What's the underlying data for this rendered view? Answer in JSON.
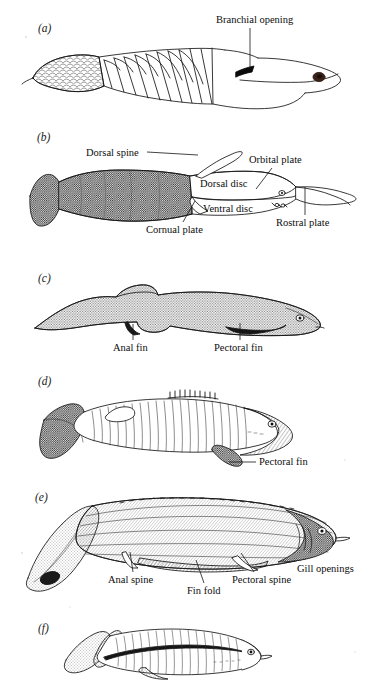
{
  "figure": {
    "background_color": "#ffffff",
    "ink_color": "#111111",
    "caption_note": "Six labeled lateral-view reconstructions of early jawless and jawed fishes",
    "panels": [
      {
        "id": "a",
        "letter": "(a)",
        "letter_x": 38,
        "letter_y": 22,
        "annotations": [
          {
            "name": "branchial-opening",
            "text": "Branchial opening",
            "x": 216,
            "y": 14,
            "leader": {
              "type": "vertical",
              "x1": 250,
              "y1": 28,
              "x2": 250,
              "y2": 68
            }
          }
        ]
      },
      {
        "id": "b",
        "letter": "(b)",
        "letter_x": 37,
        "letter_y": 131,
        "annotations": [
          {
            "name": "dorsal-spine",
            "text": "Dorsal spine",
            "x": 86,
            "y": 147,
            "leader": {
              "type": "horizontal",
              "x1": 146,
              "y1": 153,
              "x2": 196,
              "y2": 153
            }
          },
          {
            "name": "orbital-plate",
            "text": "Orbital plate",
            "x": 249,
            "y": 154,
            "leader": {
              "type": "diagonal",
              "x1": 272,
              "y1": 168,
              "x2": 252,
              "y2": 190
            }
          },
          {
            "name": "dorsal-disc",
            "text": "Dorsal disc",
            "x": 200,
            "y": 178
          },
          {
            "name": "ventral-disc",
            "text": "Ventral disc",
            "x": 203,
            "y": 203
          },
          {
            "name": "cornual-plate",
            "text": "Cornual plate",
            "x": 146,
            "y": 224,
            "leader": {
              "type": "diagonal",
              "x1": 183,
              "y1": 222,
              "x2": 194,
              "y2": 200
            }
          },
          {
            "name": "rostral-plate",
            "text": "Rostral plate",
            "x": 276,
            "y": 217,
            "leader": {
              "type": "vertical",
              "x1": 305,
              "y1": 215,
              "x2": 305,
              "y2": 186
            }
          }
        ]
      },
      {
        "id": "c",
        "letter": "(c)",
        "letter_x": 38,
        "letter_y": 272,
        "annotations": [
          {
            "name": "anal-fin",
            "text": "Anal fin",
            "x": 113,
            "y": 342,
            "leader": {
              "type": "vertical",
              "x1": 133,
              "y1": 340,
              "x2": 133,
              "y2": 323
            }
          },
          {
            "name": "pectoral-fin",
            "text": "Pectoral fin",
            "x": 214,
            "y": 342,
            "leader": {
              "type": "vertical",
              "x1": 240,
              "y1": 340,
              "x2": 240,
              "y2": 322
            }
          }
        ]
      },
      {
        "id": "d",
        "letter": "(d)",
        "letter_x": 38,
        "letter_y": 375,
        "annotations": [
          {
            "name": "pectoral-fin",
            "text": "Pectoral fin",
            "x": 259,
            "y": 456,
            "leader": {
              "type": "horizontal",
              "x1": 229,
              "y1": 462,
              "x2": 256,
              "y2": 462
            }
          }
        ]
      },
      {
        "id": "e",
        "letter": "(e)",
        "letter_x": 35,
        "letter_y": 491,
        "annotations": [
          {
            "name": "anal-spine",
            "text": "Anal spine",
            "x": 108,
            "y": 574,
            "leader": {
              "type": "diagonal",
              "x1": 133,
              "y1": 572,
              "x2": 131,
              "y2": 551
            }
          },
          {
            "name": "fin-fold",
            "text": "Fin fold",
            "x": 187,
            "y": 585,
            "leader": {
              "type": "diagonal",
              "x1": 203,
              "y1": 583,
              "x2": 196,
              "y2": 559
            }
          },
          {
            "name": "pectoral-spine",
            "text": "Pectoral spine",
            "x": 232,
            "y": 574,
            "leader": {
              "type": "diagonal",
              "x1": 254,
              "y1": 572,
              "x2": 241,
              "y2": 552
            }
          },
          {
            "name": "gill-openings",
            "text": "Gill openings",
            "x": 297,
            "y": 563
          }
        ]
      },
      {
        "id": "f",
        "letter": "(f)",
        "letter_x": 38,
        "letter_y": 622,
        "annotations": []
      }
    ]
  }
}
